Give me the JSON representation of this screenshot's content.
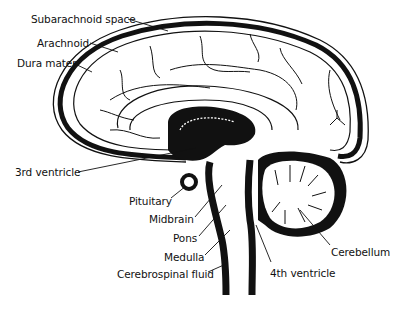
{
  "diagram": {
    "colors": {
      "ink": "#111111",
      "background": "#ffffff"
    },
    "labels": [
      {
        "id": "subarachnoid-space",
        "text": "Subarachnoid space",
        "x": 31,
        "y": 13
      },
      {
        "id": "arachnoid",
        "text": "Arachnoid",
        "x": 37,
        "y": 37
      },
      {
        "id": "dura-mater",
        "text": "Dura mater",
        "x": 17,
        "y": 57
      },
      {
        "id": "third-ventricle",
        "text": "3rd ventricle",
        "x": 15,
        "y": 166
      },
      {
        "id": "pituitary",
        "text": "Pituitary",
        "x": 129,
        "y": 195
      },
      {
        "id": "midbrain",
        "text": "Midbrain",
        "x": 149,
        "y": 213
      },
      {
        "id": "pons",
        "text": "Pons",
        "x": 173,
        "y": 232
      },
      {
        "id": "medulla",
        "text": "Medulla",
        "x": 164,
        "y": 251
      },
      {
        "id": "cerebrospinal-fluid",
        "text": "Cerebrospinal fluid",
        "x": 117,
        "y": 268
      },
      {
        "id": "cerebellum",
        "text": "Cerebellum",
        "x": 331,
        "y": 246
      },
      {
        "id": "fourth-ventricle",
        "text": "4th ventricle",
        "x": 270,
        "y": 267
      }
    ]
  }
}
